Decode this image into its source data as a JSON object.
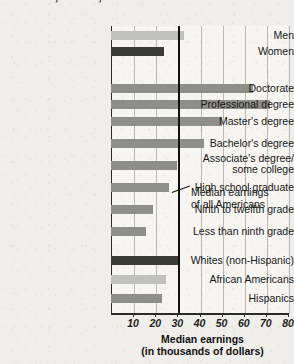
{
  "title": {
    "line1": "Gender, Race, and Education Level",
    "line1_clipped_above": "Median Earnings by"
  },
  "annotation": {
    "line1": "Median earnings",
    "line2": "of all Americans"
  },
  "axis_title": {
    "line1": "Median earnings",
    "line2": "(in thousands of dollars)"
  },
  "colors": {
    "bar_light": "#c2c2bd",
    "bar_medium": "#8f8f8a",
    "bar_dark": "#3a3a38",
    "median_line": "#111111",
    "plot_background": "#f6f5f2",
    "page_background": "#efeeea",
    "title_text": "#4b4b4b"
  },
  "chart_data": {
    "type": "bar",
    "orientation": "horizontal",
    "xlabel": "Median earnings (in thousands of dollars)",
    "ylabel": "",
    "xlim": [
      0,
      80
    ],
    "xticks": [
      10,
      20,
      30,
      40,
      50,
      60,
      70,
      80
    ],
    "xticklabels": [
      "10",
      "20",
      "30",
      "40",
      "50",
      "60",
      "70",
      "80"
    ],
    "grid": true,
    "legend": false,
    "reference_line": {
      "value": 30,
      "label": "Median earnings of all Americans"
    },
    "groups": [
      {
        "name": "Gender",
        "categories": [
          "Men",
          "Women"
        ],
        "values": [
          33,
          24
        ],
        "shades": [
          "bar_light",
          "bar_dark"
        ]
      },
      {
        "name": "Education Level",
        "categories": [
          "Doctorate",
          "Professional degree",
          "Master's degree",
          "Bachelor's degree",
          "Associate's degree/ some college",
          "High school graduate",
          "Ninth to twelfth grade",
          "Less than ninth grade"
        ],
        "values": [
          64,
          72,
          50,
          42,
          30,
          26,
          19,
          16
        ],
        "shades": [
          "bar_medium",
          "bar_medium",
          "bar_medium",
          "bar_medium",
          "bar_medium",
          "bar_medium",
          "bar_medium",
          "bar_medium"
        ]
      },
      {
        "name": "Race and Ethnicity",
        "categories": [
          "Whites (non-Hispanic)",
          "African Americans",
          "Hispanics"
        ],
        "values": [
          31,
          25,
          23
        ],
        "shades": [
          "bar_dark",
          "bar_light",
          "bar_medium"
        ]
      }
    ]
  },
  "bars": [
    {
      "label": "Men",
      "label2": "",
      "value": 33,
      "shade": "bar_light",
      "top": 31,
      "label_top": 30
    },
    {
      "label": "Women",
      "label2": "",
      "value": 24,
      "shade": "bar_dark",
      "top": 47,
      "label_top": 46
    },
    {
      "label": "Doctorate",
      "label2": "",
      "value": 64,
      "shade": "bar_medium",
      "top": 84,
      "label_top": 83
    },
    {
      "label": "Professional degree",
      "label2": "",
      "value": 72,
      "shade": "bar_medium",
      "top": 100,
      "label_top": 99
    },
    {
      "label": "Master's degree",
      "label2": "",
      "value": 50,
      "shade": "bar_medium",
      "top": 117,
      "label_top": 116
    },
    {
      "label": "Bachelor's degree",
      "label2": "",
      "value": 42,
      "shade": "bar_medium",
      "top": 139,
      "label_top": 138
    },
    {
      "label": "Associate's degree/",
      "label2": "some college",
      "value": 30,
      "shade": "bar_medium",
      "top": 161,
      "label_top": 153
    },
    {
      "label": "High school graduate",
      "label2": "",
      "value": 26,
      "shade": "bar_medium",
      "top": 183,
      "label_top": 182
    },
    {
      "label": "Ninth to twelfth grade",
      "label2": "",
      "value": 19,
      "shade": "bar_medium",
      "top": 205,
      "label_top": 204
    },
    {
      "label": "Less than ninth grade",
      "label2": "",
      "value": 16,
      "shade": "bar_medium",
      "top": 227,
      "label_top": 226
    },
    {
      "label": "Whites (non-Hispanic)",
      "label2": "",
      "value": 31,
      "shade": "bar_dark",
      "top": 256,
      "label_top": 255
    },
    {
      "label": "African Americans",
      "label2": "",
      "value": 25,
      "shade": "bar_light",
      "top": 275,
      "label_top": 274
    },
    {
      "label": "Hispanics",
      "label2": "",
      "value": 23,
      "shade": "bar_medium",
      "top": 294,
      "label_top": 293
    }
  ]
}
